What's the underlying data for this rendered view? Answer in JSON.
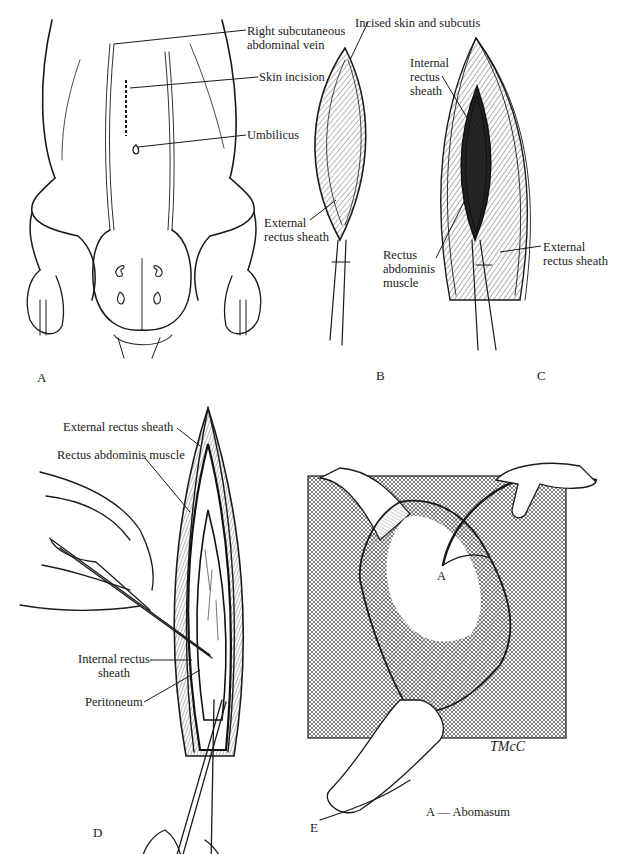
{
  "figure": {
    "panels": [
      {
        "id": "A",
        "letter": "A",
        "description": "Ventral view of calf abdomen showing incision site",
        "labels": [
          {
            "text_line1": "Right subcutaneous",
            "text_line2": "abdominal vein"
          },
          {
            "text_line1": "Skin incision"
          },
          {
            "text_line1": "Umbilicus"
          }
        ]
      },
      {
        "id": "B",
        "letter": "B",
        "description": "Incision through skin and subcutis",
        "labels": [
          {
            "text_line1": "Incised skin and subcutis"
          },
          {
            "text_line1": "External",
            "text_line2": "rectus sheath"
          }
        ]
      },
      {
        "id": "C",
        "letter": "C",
        "description": "External rectus sheath incised exposing rectus abdominis",
        "labels": [
          {
            "text_line1": "Internal",
            "text_line2": "rectus",
            "text_line3": "sheath"
          },
          {
            "text_line1": "Rectus",
            "text_line2": "abdominis",
            "text_line3": "muscle"
          },
          {
            "text_line1": "External",
            "text_line2": "rectus sheath"
          }
        ]
      },
      {
        "id": "D",
        "letter": "D",
        "description": "Peritoneum tented and incised with scissors",
        "labels": [
          {
            "text_line1": "External rectus sheath"
          },
          {
            "text_line1": "Rectus abdominis muscle"
          },
          {
            "text_line1": "Internal rectus",
            "text_line2": "sheath"
          },
          {
            "text_line1": "Peritoneum"
          }
        ]
      },
      {
        "id": "E",
        "letter": "E",
        "description": "Abomasum exteriorized on drape with tube inserted",
        "labels": [
          {
            "text_line1": "A"
          }
        ],
        "legend": "A — Abomasum",
        "signature": "TMcC"
      }
    ]
  }
}
